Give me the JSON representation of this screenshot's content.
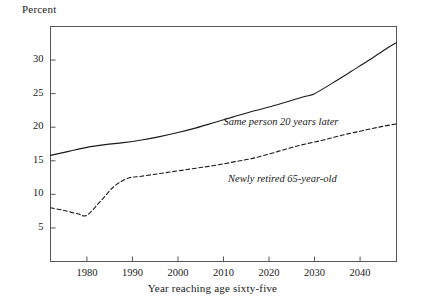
{
  "chart_data": {
    "type": "line",
    "title": "",
    "xlabel": "Year reaching age sixty-five",
    "ylabel": "Percent",
    "xlim": [
      1972,
      2048
    ],
    "ylim": [
      0,
      35
    ],
    "xticks": [
      1980,
      1990,
      2000,
      2010,
      2020,
      2030,
      2040
    ],
    "yticks": [
      5,
      10,
      15,
      20,
      25,
      30
    ],
    "grid": false,
    "legend_position": "inline-annotations",
    "series": [
      {
        "name": "Same person 20 years later",
        "style": "solid",
        "color": "#1a1a1a",
        "x": [
          1972,
          1976,
          1980,
          1984,
          1988,
          1992,
          1996,
          2000,
          2004,
          2008,
          2012,
          2016,
          2020,
          2024,
          2028,
          2030,
          2034,
          2038,
          2042,
          2046,
          2048
        ],
        "values": [
          15.8,
          16.4,
          17.0,
          17.4,
          17.7,
          18.1,
          18.6,
          19.2,
          19.9,
          20.7,
          21.5,
          22.3,
          23.0,
          23.8,
          24.6,
          25.0,
          26.6,
          28.3,
          30.0,
          31.8,
          32.6
        ]
      },
      {
        "name": "Newly retired 65-year-old",
        "style": "dashed",
        "color": "#1a1a1a",
        "x": [
          1972,
          1975,
          1978,
          1980,
          1983,
          1986,
          1989,
          1992,
          1996,
          2000,
          2004,
          2008,
          2012,
          2016,
          2020,
          2024,
          2028,
          2032,
          2036,
          2040,
          2044,
          2048
        ],
        "values": [
          8.0,
          7.6,
          7.1,
          6.9,
          9.0,
          11.2,
          12.4,
          12.7,
          13.1,
          13.5,
          13.9,
          14.3,
          14.8,
          15.3,
          16.0,
          16.8,
          17.5,
          18.1,
          18.8,
          19.4,
          20.0,
          20.5
        ]
      }
    ],
    "annotations": [
      {
        "text": "Same person 20 years later",
        "x": 2010,
        "y": 20.6
      },
      {
        "text": "Newly retired 65-year-old",
        "x": 2011,
        "y": 12.1
      }
    ]
  },
  "axis": {
    "y_title": "Percent",
    "x_title": "Year reaching age sixty-five",
    "y_tick_labels": [
      "5",
      "10",
      "15",
      "20",
      "25",
      "30"
    ],
    "x_tick_labels": [
      "1980",
      "1990",
      "2000",
      "2010",
      "2020",
      "2030",
      "2040"
    ]
  },
  "style": {
    "frame_color": "#555555",
    "line_color": "#1a1a1a",
    "background": "#ffffff"
  }
}
